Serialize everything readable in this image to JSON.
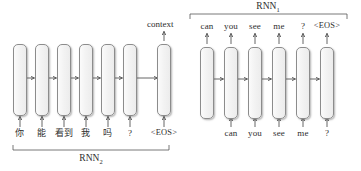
{
  "diagram": {
    "context_label": "context",
    "encoder": {
      "group_label": "RNN",
      "group_subscript": "2",
      "cell_count": 7,
      "input_tokens": [
        "你",
        "能",
        "看到",
        "我",
        "吗",
        "?",
        "<EOS>"
      ],
      "cell_x": [
        13,
        58,
        103,
        148,
        193,
        238,
        283
      ],
      "cells": [
        {
          "id": "enc-cell-1",
          "input": "你"
        },
        {
          "id": "enc-cell-2",
          "input": "能"
        },
        {
          "id": "enc-cell-3",
          "input": "看到"
        },
        {
          "id": "enc-cell-4",
          "input": "我"
        },
        {
          "id": "enc-cell-5",
          "input": "吗"
        },
        {
          "id": "enc-cell-6",
          "input": "?"
        },
        {
          "id": "enc-cell-7",
          "input": "<EOS>"
        }
      ]
    },
    "decoder": {
      "group_label": "RNN",
      "group_subscript": "1",
      "cell_count": 6,
      "output_tokens": [
        "can",
        "you",
        "see",
        "me",
        "?",
        "<EOS>"
      ],
      "input_tokens": [
        "",
        "can",
        "you",
        "see",
        "me",
        "?"
      ],
      "cells": [
        {
          "id": "dec-cell-1",
          "output": "can",
          "input": ""
        },
        {
          "id": "dec-cell-2",
          "output": "you",
          "input": "can"
        },
        {
          "id": "dec-cell-3",
          "output": "see",
          "input": "you"
        },
        {
          "id": "dec-cell-4",
          "output": "me",
          "input": "see"
        },
        {
          "id": "dec-cell-5",
          "output": "?",
          "input": "me"
        },
        {
          "id": "dec-cell-6",
          "output": "<EOS>",
          "input": "?"
        }
      ]
    },
    "colors": {
      "cell_fill": "#f3f3f3",
      "cell_stroke": "#8c8c8c",
      "arrow": "#555555",
      "text": "#2e2e2e",
      "background": "#ffffff"
    }
  }
}
